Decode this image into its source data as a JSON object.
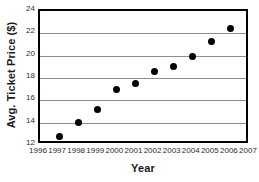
{
  "chart_data": {
    "type": "scatter",
    "title": "",
    "xlabel": "Year",
    "ylabel": "Avg. Ticket Price ($)",
    "xlim": [
      1996,
      2007
    ],
    "ylim": [
      12,
      24
    ],
    "grid": true,
    "legend": "none",
    "x_ticks": [
      1996,
      1997,
      1998,
      1999,
      2000,
      2001,
      2002,
      2003,
      2004,
      2005,
      2006,
      2007
    ],
    "x_tick_labels": [
      "1996",
      "1997",
      "1998",
      "1999",
      "2000",
      "2001",
      "2002",
      "2003",
      "2004",
      "2005",
      "2006",
      "2007"
    ],
    "y_ticks": [
      12,
      14,
      16,
      18,
      20,
      22,
      24
    ],
    "y_tick_labels": [
      "12",
      "14",
      "16",
      "18",
      "20",
      "22",
      "24"
    ],
    "gridline_values": [
      14,
      16,
      18,
      20,
      22
    ],
    "marker": "filled-circle",
    "marker_color": "#000000",
    "x": [
      1997,
      1998,
      1999,
      2000,
      2001,
      2002,
      2003,
      2004,
      2005,
      2006
    ],
    "values": [
      12.75,
      14.0,
      15.15,
      17.0,
      17.5,
      18.55,
      19.0,
      19.9,
      21.3,
      22.4
    ],
    "points": [
      {
        "year": "1997",
        "price": 12.75
      },
      {
        "year": "1998",
        "price": 14.0
      },
      {
        "year": "1999",
        "price": 15.15
      },
      {
        "year": "2000",
        "price": 17.0
      },
      {
        "year": "2001",
        "price": 17.5
      },
      {
        "year": "2002",
        "price": 18.55
      },
      {
        "year": "2003",
        "price": 19.0
      },
      {
        "year": "2004",
        "price": 19.9
      },
      {
        "year": "2005",
        "price": 21.3
      },
      {
        "year": "2006",
        "price": 22.4
      }
    ]
  },
  "colors": {
    "axis": "#000000",
    "grid": "#8e8e8e",
    "marker": "#000000",
    "text": "#1a1a1a",
    "background": "#ffffff"
  }
}
